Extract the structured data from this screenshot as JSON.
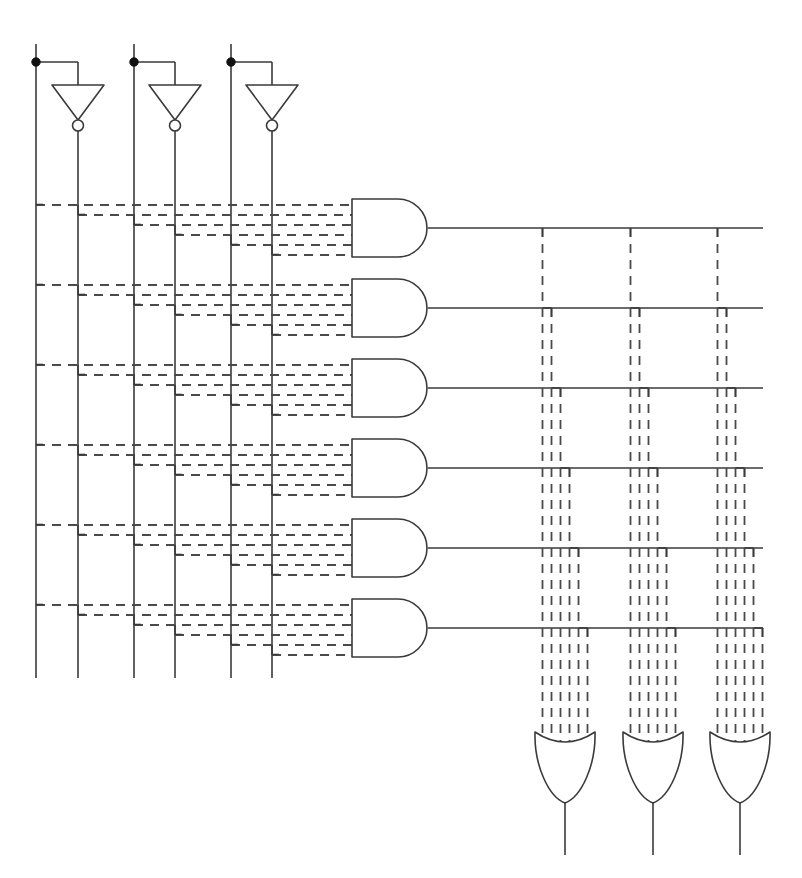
{
  "diagram": {
    "type": "logic-circuit",
    "stroke_color": "#3a3a3a",
    "dash_color": "#4a4a4a",
    "background": "#ffffff",
    "canvas": {
      "width": 802,
      "height": 878
    }
  },
  "inputs": {
    "count": 3,
    "label_prefix": "input",
    "tap_dot_y": 62,
    "stem_top_y": 44,
    "columns": [
      {
        "name": "input-1-true",
        "x": 36,
        "kind": "true"
      },
      {
        "name": "input-1-inv",
        "x": 78,
        "kind": "inverted"
      },
      {
        "name": "input-2-true",
        "x": 134,
        "kind": "true"
      },
      {
        "name": "input-2-inv",
        "x": 175,
        "kind": "inverted"
      },
      {
        "name": "input-3-true",
        "x": 231,
        "kind": "true"
      },
      {
        "name": "input-3-inv",
        "x": 272,
        "kind": "inverted"
      }
    ],
    "column_bottom_y": 678
  },
  "inverters": {
    "count": 3,
    "tri_half_width": 26,
    "tri_top_y": 85,
    "tri_bottom_y": 120,
    "bubble_r": 5.5,
    "items": [
      {
        "name": "inverter-1",
        "tap_x": 36,
        "apex_x": 78
      },
      {
        "name": "inverter-2",
        "tap_x": 134,
        "apex_x": 175
      },
      {
        "name": "inverter-3",
        "tap_x": 231,
        "apex_x": 272
      }
    ]
  },
  "and_plane": {
    "gate_count": 6,
    "gate_left_x": 352,
    "gate_body_right_x": 398,
    "gate_right_x": 428,
    "gate_height": 58,
    "row_pitch": 80,
    "first_gate_top_y": 199,
    "output_right_x": 763,
    "input_stub_count": 6,
    "input_stub_ys": [
      6,
      16,
      26,
      36,
      46,
      56
    ],
    "gates": [
      {
        "name": "and-gate-1",
        "top_y": 199,
        "out_y": 228
      },
      {
        "name": "and-gate-2",
        "top_y": 279,
        "out_y": 308
      },
      {
        "name": "and-gate-3",
        "top_y": 359,
        "out_y": 388
      },
      {
        "name": "and-gate-4",
        "top_y": 439,
        "out_y": 468
      },
      {
        "name": "and-gate-5",
        "top_y": 519,
        "out_y": 548
      },
      {
        "name": "and-gate-6",
        "top_y": 599,
        "out_y": 628
      }
    ]
  },
  "or_plane": {
    "gate_count": 3,
    "gate_width": 60,
    "gate_top_y": 732,
    "gate_shoulder_y": 746,
    "gate_tip_y": 803,
    "stem_bottom_y": 855,
    "input_count_per_gate": 6,
    "input_spacing": 9,
    "gates": [
      {
        "name": "or-gate-1",
        "left_x": 535,
        "center_x": 565
      },
      {
        "name": "or-gate-2",
        "left_x": 623,
        "center_x": 653
      },
      {
        "name": "or-gate-3",
        "left_x": 710,
        "center_x": 740
      }
    ]
  },
  "colors": {
    "line": "#3a3a3a",
    "dash": "#4a4a4a",
    "junction": "#111111",
    "fill": "#ffffff"
  }
}
